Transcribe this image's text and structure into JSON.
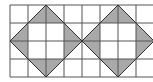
{
  "diagram": {
    "type": "grid-with-shaded-triangles",
    "grid": {
      "columns": 8,
      "rows": 4,
      "cell_size": 18,
      "origin_x": 10,
      "origin_y": 5,
      "line_color": "#555555"
    },
    "fill_color": "#a9a9a9",
    "diamonds": [
      {
        "center_col": 2,
        "center_row": 2,
        "half_diagonal_cells": 2
      },
      {
        "center_col": 6,
        "center_row": 2,
        "half_diagonal_cells": 2
      }
    ]
  }
}
